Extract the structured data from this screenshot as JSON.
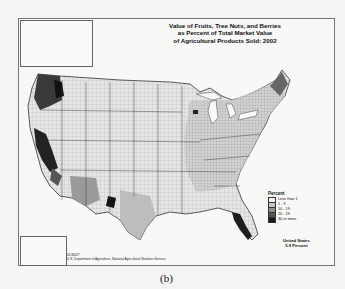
{
  "map": {
    "title_lines": [
      "Value of Fruits, Tree Nuts, and Berries",
      "as Percent of Total Market Value",
      "of Agricultural Products Sold:  2002"
    ],
    "legend": {
      "title": "Percent",
      "items": [
        {
          "label": "Less than 1",
          "color": "#f2f2f2"
        },
        {
          "label": "1 - 9",
          "color": "#c4c4c4"
        },
        {
          "label": "10 - 19",
          "color": "#8e8e8e"
        },
        {
          "label": "20 - 29",
          "color": "#555555"
        },
        {
          "label": "30 or more",
          "color": "#1a1a1a"
        }
      ]
    },
    "summary": {
      "line1": "United States",
      "line2": "5.9 Percent"
    },
    "credit": {
      "code": "02-M027",
      "source": "U.S. Department of Agriculture, National Agricultural Statistics Service"
    },
    "insets": [
      "Alaska",
      "Hawaii"
    ]
  },
  "caption": "(b)"
}
